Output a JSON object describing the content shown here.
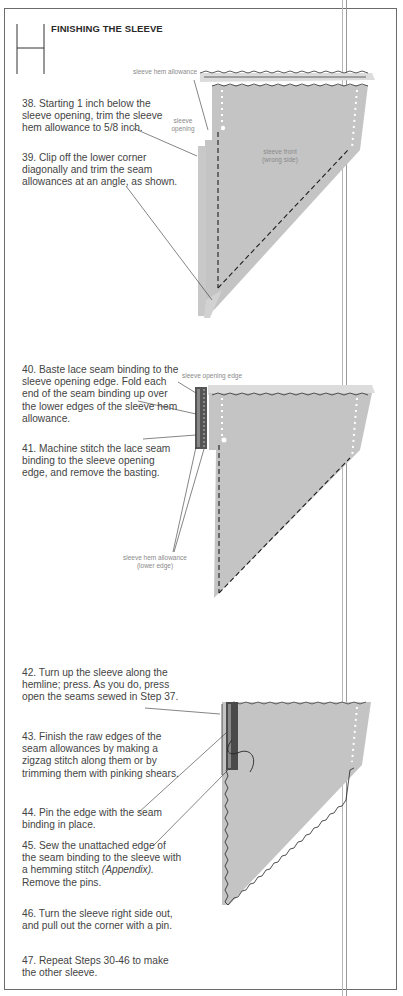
{
  "header": {
    "title": "FINISHING THE SLEEVE"
  },
  "steps": [
    {
      "id": 38,
      "text": "38. Starting 1 inch below the sleeve opening, trim the sleeve hem allowance to 5/8 inch."
    },
    {
      "id": 39,
      "text": "39. Clip off the lower corner diagonally and trim the seam allowances at an angle, as shown."
    },
    {
      "id": 40,
      "text": "40. Baste lace seam binding to the sleeve opening edge. Fold each end of the seam binding up over the lower edges of the sleeve hem allowance."
    },
    {
      "id": 41,
      "text": "41. Machine stitch the lace seam binding to the sleeve opening edge, and remove the basting."
    },
    {
      "id": 42,
      "text": "42. Turn up the sleeve along the hemline; press. As you do, press open the seams sewed in Step 37."
    },
    {
      "id": 43,
      "text": "43. Finish the raw edges of the seam allowances by making a zigzag stitch along them or by trimming them with pinking shears."
    },
    {
      "id": 44,
      "text": "44. Pin the edge with the seam binding in place."
    },
    {
      "id": 45,
      "text_before": "45. Sew the unattached edge of the seam binding to the sleeve with a hemming stitch ",
      "text_em": "(Appendix).",
      "text_after": " Remove the pins."
    },
    {
      "id": 46,
      "text": "46. Turn the sleeve right side out, and pull out the corner with a pin."
    },
    {
      "id": 47,
      "text": "47. Repeat Steps 30-46 to make the other sleeve."
    }
  ],
  "figures": {
    "fig1": {
      "labels": {
        "hem_allowance": "sleeve hem allowance",
        "opening_line1": "sleeve",
        "opening_line2": "opening",
        "front_line1": "sleeve front",
        "front_line2": "(wrong side)"
      }
    },
    "fig2": {
      "labels": {
        "opening_edge": "sleeve opening edge",
        "hem_lower_line1": "sleeve hem allowance",
        "hem_lower_line2": "(lower edge)"
      }
    }
  },
  "colors": {
    "fabric": "#c4c4c4",
    "fabric_light": "#d8d8d8",
    "stitch": "#1e1e1e",
    "text": "#444444",
    "label": "#8a8a8a"
  }
}
